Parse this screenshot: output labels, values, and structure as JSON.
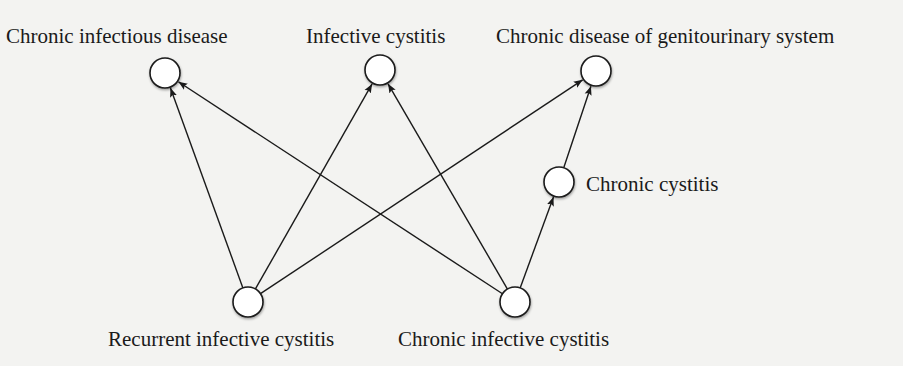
{
  "diagram": {
    "type": "directed-graph",
    "colors": {
      "background": "#f3f3f1",
      "stroke": "#1a1a1a",
      "node_fill": "#ffffff"
    },
    "nodes": [
      {
        "id": "chronic_infectious_disease",
        "label": "Chronic infectious disease",
        "cx": 165,
        "cy": 73
      },
      {
        "id": "infective_cystitis",
        "label": "Infective cystitis",
        "cx": 380,
        "cy": 70
      },
      {
        "id": "chronic_disease_gu",
        "label": "Chronic disease of genitourinary system",
        "cx": 596,
        "cy": 71
      },
      {
        "id": "chronic_cystitis",
        "label": "Chronic cystitis",
        "cx": 559,
        "cy": 182
      },
      {
        "id": "recurrent_infective_cystitis",
        "label": "Recurrent infective cystitis",
        "cx": 248,
        "cy": 302
      },
      {
        "id": "chronic_infective_cystitis",
        "label": "Chronic infective cystitis",
        "cx": 515,
        "cy": 302
      }
    ],
    "edges": [
      {
        "from": "recurrent_infective_cystitis",
        "to": "chronic_infectious_disease"
      },
      {
        "from": "recurrent_infective_cystitis",
        "to": "infective_cystitis"
      },
      {
        "from": "recurrent_infective_cystitis",
        "to": "chronic_disease_gu"
      },
      {
        "from": "chronic_infective_cystitis",
        "to": "chronic_infectious_disease"
      },
      {
        "from": "chronic_infective_cystitis",
        "to": "infective_cystitis"
      },
      {
        "from": "chronic_infective_cystitis",
        "to": "chronic_cystitis"
      },
      {
        "from": "chronic_cystitis",
        "to": "chronic_disease_gu"
      }
    ]
  },
  "labels": {
    "chronic_infectious_disease": "Chronic infectious disease",
    "infective_cystitis": "Infective cystitis",
    "chronic_disease_gu": "Chronic disease of genitourinary system",
    "chronic_cystitis": "Chronic cystitis",
    "recurrent_infective_cystitis": "Recurrent infective cystitis",
    "chronic_infective_cystitis": "Chronic infective cystitis"
  }
}
